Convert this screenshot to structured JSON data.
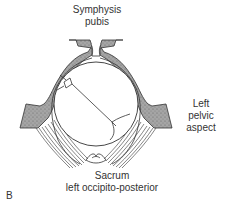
{
  "labels": {
    "symphysis_line1": "Symphysis",
    "symphysis_line2": "pubis",
    "left_line1": "Left",
    "left_line2": "pelvic",
    "left_line3": "aspect",
    "sacrum_line1": "Sacrum",
    "sacrum_line2": "left occipito-posterior",
    "panel": "B"
  },
  "colors": {
    "bone_fill": "#9a9a9a",
    "stroke": "#333333",
    "background": "#ffffff"
  }
}
